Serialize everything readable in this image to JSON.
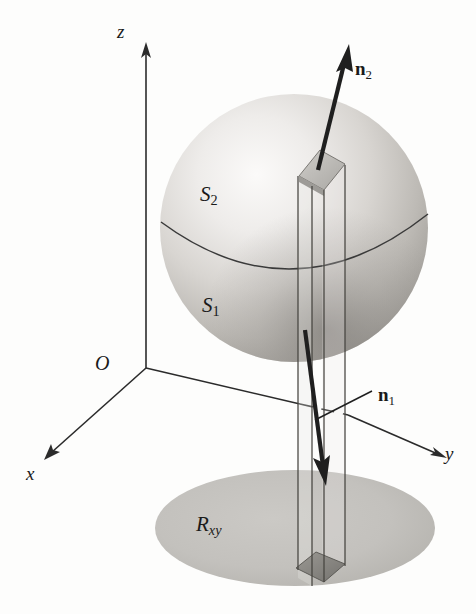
{
  "figure": {
    "background_color": "#fdfdfc",
    "ink_color": "#1a1a1a"
  },
  "axes": {
    "z": {
      "label": "z",
      "arrow": "up"
    },
    "x": {
      "label": "x",
      "arrow": "down-left"
    },
    "y": {
      "label": "y",
      "arrow": "right"
    },
    "origin": {
      "label": "O"
    }
  },
  "surfaces": {
    "upper": {
      "label": "S",
      "sub": "2"
    },
    "lower": {
      "label": "S",
      "sub": "1"
    },
    "region": {
      "label": "R",
      "sub": "xy"
    }
  },
  "normals": {
    "upper": {
      "label": "n",
      "sub": "2",
      "direction": "outward-up"
    },
    "lower": {
      "label": "n",
      "sub": "1",
      "direction": "outward-down"
    }
  },
  "colors": {
    "sphere_light": "#f4f3f1",
    "sphere_mid": "#c8c6c2",
    "sphere_dark": "#8e8b87",
    "disk_fill": "#c2c0bc",
    "prism_face": "#b8b6b2",
    "prism_shadow": "#8a8884",
    "outline": "#2b2b2b"
  }
}
